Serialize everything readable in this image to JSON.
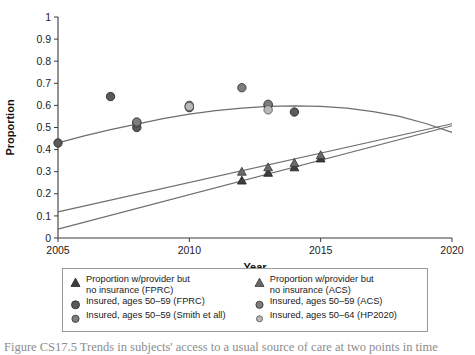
{
  "chart_data": {
    "type": "scatter",
    "title": "",
    "xlabel": "Year",
    "ylabel": "Proportion",
    "xlim": [
      2005,
      2020
    ],
    "ylim": [
      0,
      1
    ],
    "xticks": [
      "2005",
      "2010",
      "2015",
      "2020"
    ],
    "xtick_values": [
      2005,
      2010,
      2015,
      2020
    ],
    "yticks": [
      "0",
      "0.1",
      "0.2",
      "0.3",
      "0.4",
      "0.5",
      "0.6",
      "0.7",
      "0.8",
      "0.9",
      "1"
    ],
    "ytick_values": [
      0,
      0.1,
      0.2,
      0.3,
      0.4,
      0.5,
      0.6,
      0.7,
      0.8,
      0.9,
      1
    ],
    "grid": false,
    "legend_position": "below-plot",
    "series": [
      {
        "name": "Insured, ages 50-59 (FPRC)",
        "marker": "circle-dark",
        "color": "#5a5a5a",
        "points": [
          {
            "x": 2005,
            "y": 0.43
          },
          {
            "x": 2007,
            "y": 0.64
          },
          {
            "x": 2008,
            "y": 0.5
          },
          {
            "x": 2010,
            "y": 0.59
          },
          {
            "x": 2013,
            "y": 0.6
          },
          {
            "x": 2014,
            "y": 0.57
          }
        ]
      },
      {
        "name": "Insured, ages 50-59 (ACS)",
        "marker": "circle-mid",
        "color": "#7d7d7d",
        "points": [
          {
            "x": 2008,
            "y": 0.52
          },
          {
            "x": 2010,
            "y": 0.6
          },
          {
            "x": 2012,
            "y": 0.68
          },
          {
            "x": 2013,
            "y": 0.605
          }
        ]
      },
      {
        "name": "Insured, ages 50-59 (Smith et all)",
        "marker": "circle-mid",
        "color": "#7d7d7d",
        "points": [
          {
            "x": 2008,
            "y": 0.525
          },
          {
            "x": 2010,
            "y": 0.595
          }
        ]
      },
      {
        "name": "Insured, ages 50-64 (HP2020)",
        "marker": "circle-light",
        "color": "#b9b9b9",
        "points": [
          {
            "x": 2010,
            "y": 0.595
          },
          {
            "x": 2013,
            "y": 0.58
          }
        ]
      },
      {
        "name": "Proportion w/provider but no insurance (FPRC)",
        "marker": "triangle-dark",
        "color": "#3d3d3d",
        "points": [
          {
            "x": 2012,
            "y": 0.26
          },
          {
            "x": 2013,
            "y": 0.295
          },
          {
            "x": 2014,
            "y": 0.32
          },
          {
            "x": 2015,
            "y": 0.36
          }
        ]
      },
      {
        "name": "Proportion w/provider but no insurance (ACS)",
        "marker": "triangle-mid",
        "color": "#6a6a6a",
        "points": [
          {
            "x": 2012,
            "y": 0.3
          },
          {
            "x": 2013,
            "y": 0.32
          },
          {
            "x": 2014,
            "y": 0.34
          },
          {
            "x": 2015,
            "y": 0.375
          }
        ]
      }
    ],
    "trendlines": [
      {
        "name": "insured-quadratic-fit",
        "type": "quadratic",
        "color": "#6e6e6e",
        "points": [
          {
            "x": 2005,
            "y": 0.43
          },
          {
            "x": 2006,
            "y": 0.462
          },
          {
            "x": 2007,
            "y": 0.49
          },
          {
            "x": 2008,
            "y": 0.515
          },
          {
            "x": 2009,
            "y": 0.54
          },
          {
            "x": 2010,
            "y": 0.56
          },
          {
            "x": 2011,
            "y": 0.576
          },
          {
            "x": 2012,
            "y": 0.588
          },
          {
            "x": 2013,
            "y": 0.596
          },
          {
            "x": 2014,
            "y": 0.598
          },
          {
            "x": 2015,
            "y": 0.596
          },
          {
            "x": 2016,
            "y": 0.588
          },
          {
            "x": 2017,
            "y": 0.572
          },
          {
            "x": 2018,
            "y": 0.55
          },
          {
            "x": 2019,
            "y": 0.518
          },
          {
            "x": 2020,
            "y": 0.478
          }
        ]
      },
      {
        "name": "acs-linear-fit",
        "type": "linear",
        "color": "#6e6e6e",
        "points": [
          {
            "x": 2005,
            "y": 0.118
          },
          {
            "x": 2020,
            "y": 0.517
          }
        ]
      },
      {
        "name": "fprc-linear-fit",
        "type": "linear",
        "color": "#6e6e6e",
        "points": [
          {
            "x": 2005,
            "y": 0.04
          },
          {
            "x": 2020,
            "y": 0.508
          }
        ]
      }
    ]
  },
  "legend": {
    "columns": [
      {
        "items": [
          {
            "marker": "triangle-dark",
            "label": "Proportion w/provider but\nno insurance (FPRC)"
          },
          {
            "marker": "circle-dark",
            "label": "Insured, ages 50–59 (FPRC)"
          },
          {
            "marker": "circle-mid",
            "label": "Insured, ages 50–59 (Smith et all)"
          }
        ]
      },
      {
        "items": [
          {
            "marker": "triangle-mid",
            "label": "Proportion w/provider but\nno insurance (ACS)"
          },
          {
            "marker": "circle-mid",
            "label": "Insured, ages 50–59 (ACS)"
          },
          {
            "marker": "circle-light",
            "label": "Insured, ages 50–64 (HP2020)"
          }
        ]
      }
    ]
  },
  "caption": {
    "text": "Figure CS17.5   Trends in subjects' access to a usual source of care at two points in time"
  },
  "colors": {
    "marker_dark": "#5a5a5a",
    "marker_mid": "#7d7d7d",
    "marker_light": "#b9b9b9",
    "triangle_dark": "#3d3d3d",
    "triangle_mid": "#6a6a6a",
    "line": "#6e6e6e",
    "axis": "#3a3a3a"
  }
}
